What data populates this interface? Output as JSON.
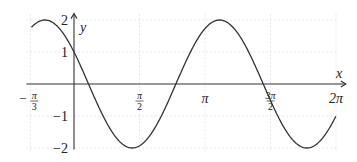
{
  "chart_data": {
    "type": "line",
    "title": "",
    "xlabel": "x",
    "ylabel": "y",
    "function": "y = 2 sin(3x/2 + 5π/6)",
    "xlim": [
      -1.0472,
      6.2832
    ],
    "ylim": [
      -2,
      2
    ],
    "grid": true,
    "x_ticks": [
      {
        "value": -1.0472,
        "label_num": "π",
        "label_den": "3",
        "sign": "−"
      },
      {
        "value": 1.5708,
        "label_num": "π",
        "label_den": "2",
        "sign": ""
      },
      {
        "value": 3.1416,
        "label": "π"
      },
      {
        "value": 4.7124,
        "label_num": "3π",
        "label_den": "2",
        "sign": ""
      },
      {
        "value": 6.2832,
        "label": "2π"
      }
    ],
    "y_ticks": [
      {
        "value": 2,
        "label": "2"
      },
      {
        "value": 1,
        "label": "1"
      },
      {
        "value": -1,
        "label": "−1"
      },
      {
        "value": -2,
        "label": "−2"
      }
    ],
    "key_points": [
      {
        "x": -0.5236,
        "y": 2,
        "note": "max"
      },
      {
        "x": 0,
        "y": 1,
        "note": "y-intercept"
      },
      {
        "x": 0.6981,
        "y": 0
      },
      {
        "x": 1.3963,
        "y": -2,
        "note": "min"
      },
      {
        "x": 2.7925,
        "y": 0
      },
      {
        "x": 3.4907,
        "y": 2,
        "note": "max"
      },
      {
        "x": 4.8869,
        "y": 0
      },
      {
        "x": 5.5851,
        "y": -2,
        "note": "min"
      }
    ]
  },
  "axes": {
    "x_label": "x",
    "y_label": "y"
  },
  "colors": {
    "curve": "#333333",
    "axis": "#333333",
    "grid": "#e6e6e6"
  }
}
